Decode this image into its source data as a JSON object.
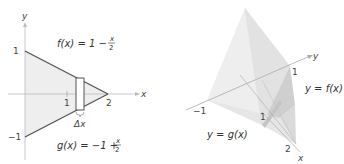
{
  "left_panel": {
    "axes": {
      "x_label": "x",
      "y_label": "y"
    },
    "ticks": {
      "y_pos": "1",
      "y_neg": "−1",
      "x_one": "1",
      "x_two": "2"
    },
    "f_label": {
      "lhs": "f(x) = 1 −",
      "num": "x",
      "den": "2"
    },
    "g_label": {
      "lhs": "g(x) = −1 +",
      "num": "x",
      "den": "2"
    },
    "delta_label": "Δx",
    "colors": {
      "region_fill": "#ececec",
      "line": "#555555",
      "axis": "#bbbbbb"
    }
  },
  "right_panel": {
    "axes": {
      "x_label": "x",
      "y_label": "y"
    },
    "ticks": {
      "y_pos": "1",
      "y_neg": "−1",
      "x_one": "1",
      "x_two": "2"
    },
    "f_label": "y = f(x)",
    "g_label": "y = g(x)",
    "colors": {
      "face_light": "#eeeeee",
      "face_mid": "#dddddd",
      "face_dark": "#c8c8c8",
      "edge": "#999999"
    }
  }
}
